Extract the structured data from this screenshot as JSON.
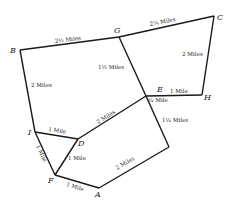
{
  "diagram": {
    "type": "road-network-map",
    "nodes": [
      {
        "id": "B",
        "label": "B",
        "x": 20,
        "y": 50
      },
      {
        "id": "G",
        "label": "G",
        "x": 119,
        "y": 37
      },
      {
        "id": "C",
        "label": "C",
        "x": 214,
        "y": 16
      },
      {
        "id": "H",
        "label": "H",
        "x": 202,
        "y": 95
      },
      {
        "id": "E",
        "label": "E",
        "x": 146,
        "y": 96
      },
      {
        "id": "I",
        "label": "I",
        "x": 35,
        "y": 132
      },
      {
        "id": "D",
        "label": "D",
        "x": 78,
        "y": 139
      },
      {
        "id": "F",
        "label": "F",
        "x": 55,
        "y": 175
      },
      {
        "id": "A",
        "label": "A",
        "x": 99,
        "y": 188
      },
      {
        "id": "R",
        "label": "",
        "x": 169,
        "y": 147
      }
    ],
    "edges": [
      {
        "from": "B",
        "to": "G",
        "label": "2½ Miles"
      },
      {
        "from": "G",
        "to": "C",
        "label": "2¼ Miles"
      },
      {
        "from": "C",
        "to": "H",
        "label": "2 Miles"
      },
      {
        "from": "B",
        "to": "I",
        "label": "2 Miles"
      },
      {
        "from": "G",
        "to": "E",
        "label": "1½ Miles"
      },
      {
        "from": "E",
        "to": "H",
        "label": "1 Mile"
      },
      {
        "from": "E",
        "to": "E'",
        "label": "¼ Mile"
      },
      {
        "from": "E",
        "to": "R",
        "label": "1¼ Miles"
      },
      {
        "from": "D",
        "to": "E",
        "label": "2 Miles"
      },
      {
        "from": "I",
        "to": "D",
        "label": "1 Mile"
      },
      {
        "from": "I",
        "to": "F",
        "label": "1 Mile"
      },
      {
        "from": "D",
        "to": "F",
        "label": "1 Mile"
      },
      {
        "from": "F",
        "to": "A",
        "label": "1 Mile"
      },
      {
        "from": "A",
        "to": "R",
        "label": "2 Miles"
      }
    ]
  },
  "labels": {
    "B": "B",
    "G": "G",
    "C": "C",
    "H": "H",
    "E": "E",
    "I": "I",
    "D": "D",
    "F": "F",
    "A": "A",
    "bg": "2½ Miles",
    "gc": "2¼ Miles",
    "ch": "2 Miles",
    "bi": "2 Miles",
    "ge": "1½ Miles",
    "eh": "1 Mile",
    "e_quarter": "¼ Mile",
    "er": "1¼ Miles",
    "de": "2 Miles",
    "id": "1 Mile",
    "if": "1 Mile",
    "df": "1 Mile",
    "fa": "1 Mile",
    "ar": "2 Miles"
  }
}
